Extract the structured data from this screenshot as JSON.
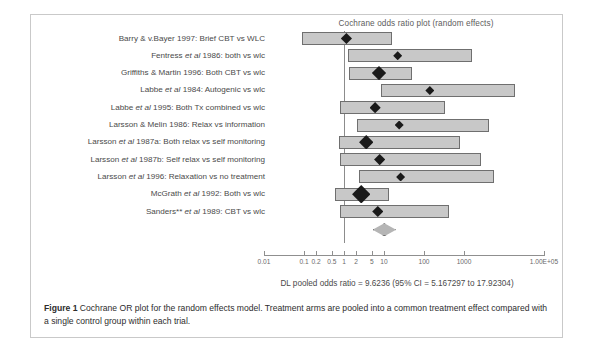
{
  "plot": {
    "title": "Cochrane odds ratio plot (random effects)",
    "pooled_summary": "DL pooled odds ratio = 9.6236 (95% CI = 5.167297 to 17.92304)"
  },
  "axis": {
    "tick_labels": [
      "0.01",
      "0.1",
      "0.2",
      "0.5",
      "1",
      "2",
      "5",
      "10",
      "100",
      "1000",
      "1.00E+05"
    ],
    "tick_values": [
      0.01,
      0.1,
      0.2,
      0.5,
      1,
      2,
      5,
      10,
      100,
      1000,
      100000
    ],
    "min": 0.01,
    "max": 100000,
    "scale": "log10"
  },
  "caption": {
    "label": "Figure 1",
    "text": "Cochrane OR plot for the random effects model. Treatment arms are pooled into a common treatment effect compared with a single control group within each trial."
  },
  "chart_data": {
    "type": "forest",
    "title": "Cochrane odds ratio plot (random effects)",
    "xlabel": "Odds ratio",
    "ylabel": "",
    "xscale": "log",
    "xlim": [
      0.01,
      100000
    ],
    "xticks": [
      0.01,
      0.1,
      0.2,
      0.5,
      1,
      2,
      5,
      10,
      100,
      1000,
      100000
    ],
    "xticklabels": [
      "0.01",
      "0.1",
      "0.2",
      "0.5",
      "1",
      "2",
      "5",
      "10",
      "100",
      "1000",
      "1.00E+05"
    ],
    "reference_line": 1,
    "grid": false,
    "legend": "none",
    "studies": [
      {
        "label_prefix": "Barry & v.Bayer 1997: Brief CBT vs WLC",
        "label_plain": "Barry & v.Bayer 1997: Brief CBT vs WLC",
        "or": 1.15,
        "ci_low": 0.09,
        "ci_high": 15.5,
        "weight": "medium"
      },
      {
        "label_prefix": "Fentress ",
        "label_italic": "et al",
        "label_suffix": " 1986: both vs wlc",
        "label_plain": "Fentress et al 1986: both vs wlc",
        "or": 22.0,
        "ci_low": 1.25,
        "ci_high": 1600,
        "weight": "small"
      },
      {
        "label_prefix": "Griffiths & Martin 1996: Both CBT vs wlc",
        "label_plain": "Griffiths & Martin 1996: Both CBT vs wlc",
        "or": 7.5,
        "ci_low": 1.3,
        "ci_high": 50,
        "weight": "large"
      },
      {
        "label_prefix": "Labbe ",
        "label_italic": "et al",
        "label_suffix": " 1984: Autogenic vs wlc",
        "label_plain": "Labbe et al 1984: Autogenic vs wlc",
        "or": 140,
        "ci_low": 8.5,
        "ci_high": 19000,
        "weight": "small"
      },
      {
        "label_prefix": "Labbe ",
        "label_italic": "et al",
        "label_suffix": " 1995: Both Tx combined vs wlc",
        "label_plain": "Labbe et al 1995: Both Tx combined vs wlc",
        "or": 6.0,
        "ci_low": 0.8,
        "ci_high": 330,
        "weight": "medium"
      },
      {
        "label_prefix": "Larsson & Melin 1986: Relax vs information",
        "label_plain": "Larsson & Melin 1986: Relax vs information",
        "or": 24.0,
        "ci_low": 2.1,
        "ci_high": 4200,
        "weight": "small"
      },
      {
        "label_prefix": "Larsson ",
        "label_italic": "et al",
        "label_suffix": " 1987a: Both relax vs self monitoring",
        "label_plain": "Larsson et al 1987a: Both relax vs self monitoring",
        "or": 3.6,
        "ci_low": 0.75,
        "ci_high": 800,
        "weight": "large"
      },
      {
        "label_prefix": "Larsson ",
        "label_italic": "et al",
        "label_suffix": " 1987b: Self relax vs self monitoring",
        "label_plain": "Larsson et al 1987b: Self relax vs self monitoring",
        "or": 7.8,
        "ci_low": 0.8,
        "ci_high": 2600,
        "weight": "medium"
      },
      {
        "label_prefix": "Larsson ",
        "label_italic": "et al",
        "label_suffix": " 1996: Relaxation vs no treatment",
        "label_plain": "Larsson et al 1996: Relaxation vs no treatment",
        "or": 26.0,
        "ci_low": 2.4,
        "ci_high": 5500,
        "weight": "small"
      },
      {
        "label_prefix": "McGrath ",
        "label_italic": "et al",
        "label_suffix": " 1992: Both vs wlc",
        "label_plain": "McGrath et al 1992: Both vs wlc",
        "or": 2.7,
        "ci_low": 0.6,
        "ci_high": 13.0,
        "weight": "xlarge"
      },
      {
        "label_prefix": "Sanders** ",
        "label_italic": "et al",
        "label_suffix": " 1989: CBT vs wlc",
        "label_plain": "Sanders** et al 1989: CBT vs wlc",
        "or": 7.0,
        "ci_low": 0.78,
        "ci_high": 430,
        "weight": "medium"
      }
    ],
    "pooled": {
      "label": "DL pooled odds ratio",
      "or": 9.6236,
      "ci_low": 5.167297,
      "ci_high": 17.92304,
      "summary": "DL pooled odds ratio = 9.6236 (95% CI = 5.167297 to 17.92304)"
    }
  }
}
